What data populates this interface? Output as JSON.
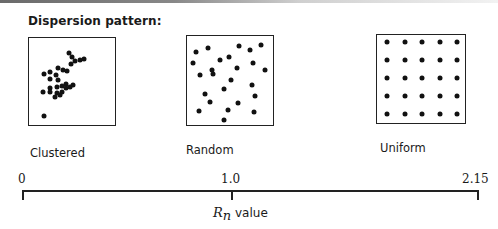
{
  "title": "Dispersion pattern:",
  "panels": [
    {
      "id": "clustered",
      "label": "Clustered",
      "box": {
        "left": 28,
        "top": 37,
        "width": 88,
        "height": 89
      },
      "label_pos": {
        "left": 30,
        "top": 146
      },
      "dots": [
        [
          69,
          53
        ],
        [
          72,
          57
        ],
        [
          75,
          61
        ],
        [
          80,
          60
        ],
        [
          84,
          59
        ],
        [
          71,
          64
        ],
        [
          44,
          74
        ],
        [
          58,
          68
        ],
        [
          50,
          72
        ],
        [
          56,
          75
        ],
        [
          63,
          70
        ],
        [
          67,
          71
        ],
        [
          50,
          79
        ],
        [
          58,
          80
        ],
        [
          66,
          84
        ],
        [
          50,
          88
        ],
        [
          57,
          87
        ],
        [
          62,
          86
        ],
        [
          66,
          88
        ],
        [
          70,
          87
        ],
        [
          73,
          85
        ],
        [
          43,
          92
        ],
        [
          50,
          92
        ],
        [
          57,
          93
        ],
        [
          62,
          92
        ],
        [
          55,
          97
        ],
        [
          60,
          95
        ],
        [
          44,
          116
        ]
      ]
    },
    {
      "id": "random",
      "label": "Random",
      "box": {
        "left": 186,
        "top": 35,
        "width": 88,
        "height": 91
      },
      "label_pos": {
        "left": 186,
        "top": 143
      },
      "dots": [
        [
          196,
          52
        ],
        [
          208,
          48
        ],
        [
          239,
          46
        ],
        [
          250,
          50
        ],
        [
          261,
          45
        ],
        [
          193,
          63
        ],
        [
          220,
          60
        ],
        [
          229,
          57
        ],
        [
          253,
          63
        ],
        [
          212,
          70
        ],
        [
          237,
          68
        ],
        [
          265,
          70
        ],
        [
          200,
          75
        ],
        [
          213,
          74
        ],
        [
          231,
          80
        ],
        [
          252,
          85
        ],
        [
          205,
          94
        ],
        [
          224,
          89
        ],
        [
          255,
          96
        ],
        [
          210,
          102
        ],
        [
          238,
          103
        ],
        [
          199,
          111
        ],
        [
          228,
          110
        ],
        [
          254,
          112
        ],
        [
          224,
          120
        ]
      ]
    },
    {
      "id": "uniform",
      "label": "Uniform",
      "box": {
        "left": 376,
        "top": 34,
        "width": 90,
        "height": 90
      },
      "label_pos": {
        "left": 380,
        "top": 141
      },
      "grid": {
        "rows": 5,
        "cols": 5,
        "x0": 387,
        "y0": 42,
        "dx": 17.5,
        "dy": 18
      }
    }
  ],
  "axis": {
    "label_symbol": "R",
    "label_subscript": "n",
    "label_text": " value",
    "ticks": [
      {
        "value": "0",
        "x": 22,
        "label_left": 18
      },
      {
        "value": "1.0",
        "x": 231,
        "label_left": 221
      },
      {
        "value": "2.15",
        "x": 477,
        "label_left": 462
      }
    ]
  }
}
